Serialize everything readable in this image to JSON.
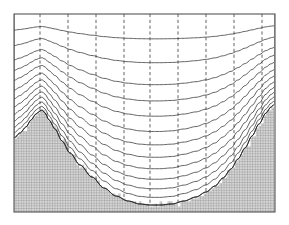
{
  "figure": {
    "background_color": "#ffffff",
    "line_color": "#3a3a3a",
    "border_color": "#555555",
    "ground_mesh_color": "#8a8a8a",
    "ground_fill_color": "#c8c8c8",
    "terrain_outline_color": "#2b2b2b"
  },
  "frame": {
    "x": 14,
    "y": 14,
    "width": 261,
    "height": 198,
    "stroke_width": 1.1
  },
  "chart_data": {
    "type": "line",
    "xlabel": "",
    "ylabel": "",
    "xlim": [
      14,
      275
    ],
    "ylim": [
      14,
      212
    ],
    "grid": true,
    "legend": null,
    "n_vertical_lines": 10,
    "n_horizontal_levels": 14,
    "vertical_line_style": "dashed",
    "horizontal_line_style": "solid",
    "terrain_profile": {
      "name": "orography",
      "comment": "Surface elevation in screen pixel coordinates; larger y is lower elevation.",
      "x": [
        14,
        20,
        26,
        31,
        36,
        40,
        42,
        45,
        49,
        55,
        62,
        70,
        80,
        92,
        104,
        116,
        128,
        140,
        150,
        160,
        172,
        184,
        196,
        206,
        215,
        223,
        231,
        238,
        245,
        252,
        259,
        266,
        271,
        275
      ],
      "y": [
        138,
        133,
        127,
        120,
        114,
        111,
        110,
        113,
        120,
        129,
        141,
        153,
        165,
        177,
        188,
        196,
        201,
        204,
        205,
        205,
        204,
        201,
        197,
        192,
        186,
        178,
        169,
        159,
        148,
        136,
        124,
        113,
        107,
        104
      ]
    },
    "sigma_levels": {
      "comment": "Fraction of the way from model top (y=14) to the ground surface for each coordinate surface.",
      "fractions": [
        0.0,
        0.13,
        0.255,
        0.37,
        0.455,
        0.535,
        0.615,
        0.685,
        0.75,
        0.81,
        0.865,
        0.915,
        0.96,
        1.0
      ]
    },
    "vertical_coordinate_lines": {
      "comment": "x positions of the dashed vertical coordinate lines.",
      "x": [
        14,
        40,
        68,
        96,
        124,
        150,
        178,
        206,
        234,
        262,
        275
      ]
    },
    "ground_mesh": {
      "comment": "Fine Cartesian mesh drawn beneath the terrain surface.",
      "spacing_x": 2.6,
      "spacing_y": 2.6,
      "stroke_width": 0.45
    }
  },
  "labels": {
    "model_top": "",
    "surface": "",
    "axis_note": ""
  }
}
